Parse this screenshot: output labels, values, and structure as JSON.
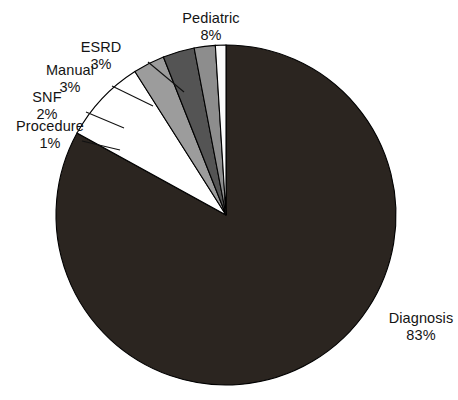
{
  "chart_data": {
    "type": "pie",
    "title": "",
    "subtitle": "",
    "xlabel": "",
    "ylabel": "",
    "legend_position": "none",
    "grid": false,
    "value_unit": "percent",
    "start_angle_deg": 0,
    "direction": "clockwise",
    "categories": [
      "Diagnosis",
      "Pediatric",
      "ESRD",
      "Manual",
      "SNF",
      "Procedure"
    ],
    "values": [
      83,
      8,
      3,
      3,
      2,
      1
    ],
    "slices": [
      {
        "label": "Diagnosis",
        "percent": 83,
        "percent_text": "83%",
        "color": "#2b2520",
        "stroke": "#000000",
        "label_placement": "outside-right",
        "has_leader_line": false
      },
      {
        "label": "Pediatric",
        "percent": 8,
        "percent_text": "8%",
        "color": "#ffffff",
        "stroke": "#000000",
        "label_placement": "outside-top",
        "has_leader_line": false
      },
      {
        "label": "ESRD",
        "percent": 3,
        "percent_text": "3%",
        "color": "#9c9c9c",
        "stroke": "#000000",
        "label_placement": "outside-upper-left",
        "has_leader_line": true
      },
      {
        "label": "Manual",
        "percent": 3,
        "percent_text": "3%",
        "color": "#545454",
        "stroke": "#000000",
        "label_placement": "outside-upper-left",
        "has_leader_line": true
      },
      {
        "label": "SNF",
        "percent": 2,
        "percent_text": "2%",
        "color": "#8d8d8d",
        "stroke": "#000000",
        "label_placement": "outside-left",
        "has_leader_line": true
      },
      {
        "label": "Procedure",
        "percent": 1,
        "percent_text": "1%",
        "color": "#fbfbfb",
        "stroke": "#000000",
        "label_placement": "outside-left",
        "has_leader_line": true
      }
    ],
    "geometry": {
      "center_x": 226,
      "center_y": 215,
      "radius": 170
    },
    "colors": {
      "background": "#ffffff",
      "outline": "#000000",
      "text": "#141414"
    }
  }
}
